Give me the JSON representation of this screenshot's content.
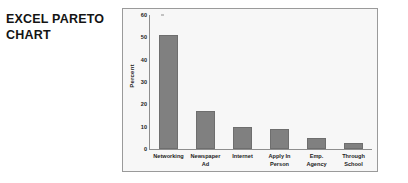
{
  "title": {
    "text": "EXCEL PARETO\nCHART"
  },
  "colors": {
    "bar_fill": "#808080",
    "bar_border": "#6e6e6e",
    "plot_background": "#f7f7f7",
    "frame_border": "#9a9a9a",
    "axis_line": "#8e8e8e",
    "text": "#1c1c1c",
    "title_text": "#141414",
    "page_background": "#ffffff"
  },
  "chart_data": {
    "type": "bar",
    "title": "",
    "xlabel": "",
    "ylabel": "Percent",
    "categories": [
      "Networking",
      "Newspaper\nAd",
      "Internet",
      "Apply In\nPerson",
      "Emp. Agency",
      "Through\nSchool"
    ],
    "values": [
      51,
      17,
      10,
      9,
      5,
      2.5
    ],
    "ylim": [
      0,
      60
    ],
    "yticks": [
      0,
      10,
      20,
      30,
      40,
      50,
      60
    ],
    "ytick_labels": [
      "0",
      "10",
      "20",
      "30",
      "40",
      "50",
      "60"
    ],
    "grid": false,
    "legend": false,
    "legend_position": "none"
  }
}
